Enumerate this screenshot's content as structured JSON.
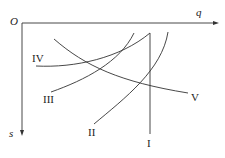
{
  "diagram": {
    "origin_label": "O",
    "x_axis_label": "q",
    "y_axis_label": "s",
    "curves": [
      {
        "id": "I",
        "label": "I"
      },
      {
        "id": "II",
        "label": "II"
      },
      {
        "id": "III",
        "label": "III"
      },
      {
        "id": "IV",
        "label": "IV"
      },
      {
        "id": "V",
        "label": "V"
      }
    ]
  }
}
